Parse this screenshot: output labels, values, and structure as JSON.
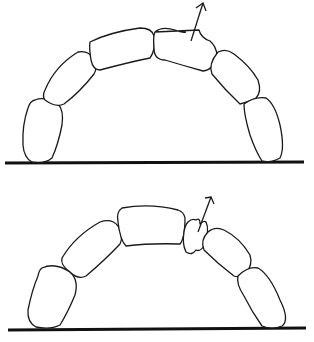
{
  "figure": {
    "panels": [
      {
        "id": "top",
        "description": "Arch of 8 rounded blocks on a base line; one block near apex being lifted out (arrow pointing up-right)",
        "block_count": 8,
        "arrow_direction": "up-right"
      },
      {
        "id": "bottom",
        "description": "Arch of blocks with a fractured/wedged small piece near apex pushed out (arrow pointing up-right)",
        "block_count": 7,
        "arrow_direction": "up-right"
      }
    ],
    "colors": {
      "line": "#1a1a1a",
      "background": "#ffffff"
    }
  }
}
